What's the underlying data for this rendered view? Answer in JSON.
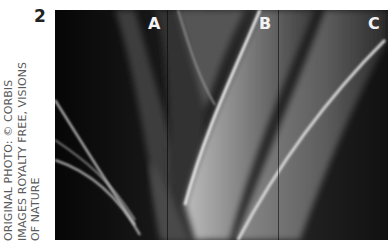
{
  "figure": {
    "number": "2",
    "credit_lines": [
      "ORIGINAL PHOTO: © CORBIS",
      "IMAGES ROYALTY FREE, VISIONS",
      "OF NATURE"
    ],
    "photo_description": "Black-and-white close-up of curved plant leaves, split into three panels",
    "panels": [
      {
        "label": "A"
      },
      {
        "label": "B"
      },
      {
        "label": "C"
      }
    ]
  }
}
